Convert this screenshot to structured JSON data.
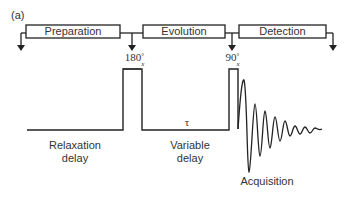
{
  "panel_label": "(a)",
  "stages": [
    {
      "label": "Preparation"
    },
    {
      "label": "Evolution"
    },
    {
      "label": "Detection"
    }
  ],
  "pulses": [
    {
      "angle": "180",
      "superscript": "°",
      "subscript": "x"
    },
    {
      "angle": "90",
      "superscript": "°",
      "subscript": "x"
    }
  ],
  "tau_symbol": "τ",
  "periods": {
    "relaxation": [
      "Relaxation",
      "delay"
    ],
    "variable": [
      "Variable",
      "delay"
    ],
    "acquisition": "Acquisition"
  },
  "colors": {
    "line": "#222222",
    "background": "#ffffff"
  }
}
